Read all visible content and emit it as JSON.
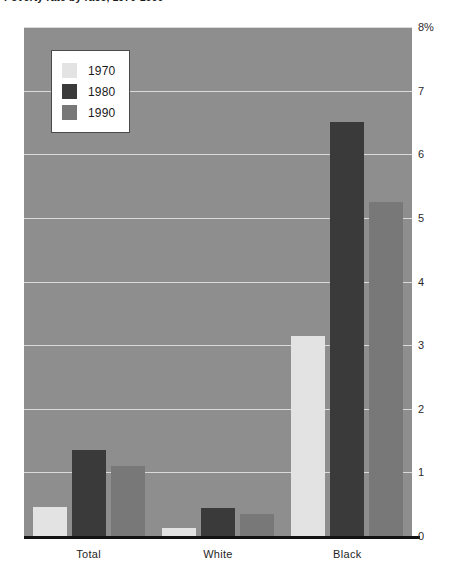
{
  "chart_data": {
    "type": "bar",
    "title": "Poverty rate by race, 1970-1990",
    "xlabel": "",
    "ylabel": "",
    "ylim": [
      0,
      8
    ],
    "ytick_labels": [
      "0",
      "1",
      "2",
      "3",
      "4",
      "5",
      "6",
      "7",
      "8%"
    ],
    "ytick_values": [
      0,
      1,
      2,
      3,
      4,
      5,
      6,
      7,
      8
    ],
    "grid": true,
    "legend_position": "upper-left-inside",
    "categories": [
      "Total",
      "White",
      "Black"
    ],
    "series": [
      {
        "name": "1970",
        "color": "#e3e3e3",
        "values": [
          0.45,
          0.12,
          3.15
        ]
      },
      {
        "name": "1980",
        "color": "#3a3a3a",
        "values": [
          1.35,
          0.44,
          6.5
        ]
      },
      {
        "name": "1990",
        "color": "#787878",
        "values": [
          1.1,
          0.34,
          5.25
        ]
      }
    ],
    "plot_background": "#8e8e8e",
    "gridline_color": "#e8e8e8",
    "axis_color": "#121212"
  }
}
